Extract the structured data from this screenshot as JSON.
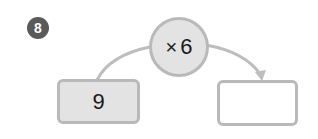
{
  "problem": {
    "number": "8",
    "operator_symbol": "×",
    "operand": "6",
    "input_value": "9",
    "output_value": ""
  },
  "colors": {
    "badge": "#5a5a5a",
    "shape_fill": "#e3e3e3",
    "border": "#b9b9b9",
    "arrow": "#bdbdbd"
  }
}
